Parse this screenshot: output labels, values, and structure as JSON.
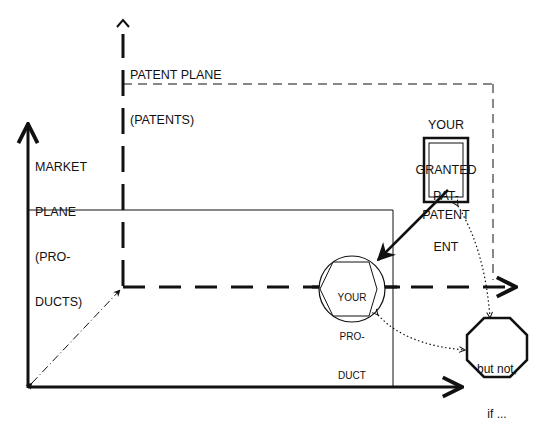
{
  "diagram": {
    "patent_plane_label": {
      "line1": "PATENT PLANE",
      "line2": "(PATENTS)"
    },
    "market_plane_label": {
      "line1": "MARKET",
      "line2": "PLANE",
      "line3": "(PRO-",
      "line4": "DUCTS)"
    },
    "granted_patent_label": {
      "line1": "YOUR",
      "line2": "GRANTED",
      "line3": "PATENT"
    },
    "patent_box": {
      "line1": "PAT-",
      "line2": "ENT"
    },
    "product_node": {
      "line1": "YOUR",
      "line2": "PRO-",
      "line3": "DUCT"
    },
    "exception_node": {
      "line1": "but not,",
      "line2": "if ..."
    },
    "colors": {
      "stroke": "#111111",
      "background": "#ffffff"
    }
  }
}
